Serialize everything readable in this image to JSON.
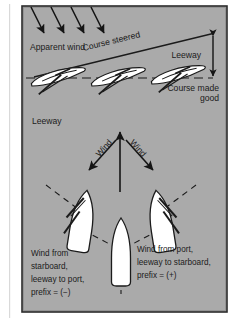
{
  "figure": {
    "background_color": "#ffffff",
    "panel_color": "#aaaaaa",
    "border_color": "#2a2a2a",
    "ink_color": "#1b1b1b",
    "hull_fill": "#ffffff"
  },
  "upper_panel": {
    "apparent_wind_label": "Apparent wind",
    "course_steered_label": "Course steered",
    "leeway_label": "Leeway",
    "course_made_good_line1": "Course made",
    "course_made_good_line2": "good",
    "wind_arrow_count": 4,
    "boat_count": 3
  },
  "middle_panel": {
    "leeway_label": "Leeway",
    "wind_label_left": "Wind",
    "wind_label_right": "Wind",
    "boat_count": 3
  },
  "lower_text": {
    "left": {
      "line1": "Wind from",
      "line2": "starboard,",
      "line3": "leeway to port,",
      "line4": "prefix = (−)"
    },
    "right": {
      "line1": "Wind from port,",
      "line2": "leeway to starboard,",
      "line3": "prefix = (+)"
    }
  }
}
